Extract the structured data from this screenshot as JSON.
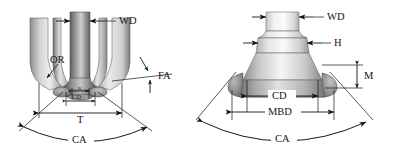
{
  "figure": {
    "type": "technical-diagram",
    "background_color": "#ffffff",
    "line_color": "#151515"
  },
  "left_diagram": {
    "name": "fluted-bur-side-view",
    "labels": {
      "wd": "WD",
      "or": "OR",
      "fa": "FA",
      "t": "T",
      "cd": "CD",
      "r": "R",
      "ca": "CA"
    }
  },
  "right_diagram": {
    "name": "stepped-bur-profile-view",
    "labels": {
      "wd": "WD",
      "h": "H",
      "m": "M",
      "cd": "CD",
      "mbd": "MBD",
      "ca": "CA"
    }
  }
}
